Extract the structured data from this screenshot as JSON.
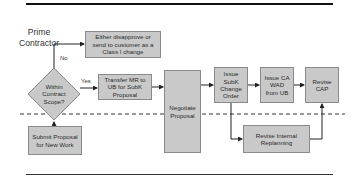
{
  "swimlane": {
    "label": "Prime Contractor"
  },
  "decision": {
    "label": "Within Contract Scope?",
    "yes_label": "Yes",
    "no_label": "No"
  },
  "boxes": {
    "reject": "Either disapprove or send to customer as a Class I change",
    "transfer": "Transfer MR to UB for SubK Proposal",
    "negotiate": "Negotiate Proposal",
    "change_order": "Issue SubK Change Order",
    "wad": "Issue CA WAD from UB",
    "revise_cap": "Revise CAP",
    "submit": "Submit Proposal for New Work",
    "replanning": "Revise Internal Replanning"
  },
  "colors": {
    "box_fill": "#c9c9c9",
    "box_border": "#8a8a8a",
    "line": "#222222",
    "rule": "#111111"
  }
}
